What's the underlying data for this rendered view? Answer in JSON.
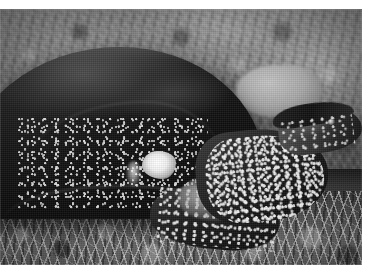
{
  "page": {
    "width": 375,
    "height": 280,
    "background_color": "#ffffff",
    "type": "photograph"
  },
  "photo": {
    "title": "Turtle resting on grass",
    "subject": "turtle",
    "color_mode": "black-and-white",
    "orientation": "landscape",
    "frame": {
      "left": 0,
      "top": 9,
      "width": 362,
      "height": 256,
      "margin_color": "#ffffff"
    },
    "regions": [
      {
        "name": "background-vegetation",
        "label": "Blurred grass and vegetation background",
        "tone": "mid-gray"
      },
      {
        "name": "background-rock",
        "label": "Pale rock behind the shell",
        "tone": "light-gray"
      },
      {
        "name": "turtle-shell",
        "label": "Dark domed carapace",
        "tone": "near-black"
      },
      {
        "name": "shell-speckles",
        "label": "White speckled pattern on shell flank",
        "tone": "white"
      },
      {
        "name": "shell-highlight",
        "label": "Bright blown-out highlight on lower shell",
        "tone": "white"
      },
      {
        "name": "turtle-neck",
        "label": "Speckled neck",
        "tone": "dark-gray"
      },
      {
        "name": "turtle-head",
        "label": "Head facing right with dark upper jaw",
        "tone": "mid-gray"
      },
      {
        "name": "turtle-eye",
        "label": "Eye",
        "tone": "highlight"
      },
      {
        "name": "turtle-foreleg",
        "label": "Speckled foreleg",
        "tone": "dark-gray"
      },
      {
        "name": "foreground-grass",
        "label": "Bright grass blades in foreground",
        "tone": "light-gray"
      }
    ],
    "palette": {
      "white": "#ffffff",
      "highlight": "#f0f0f0",
      "light_gray": "#c8c8c8",
      "mid_gray": "#7b7b7b",
      "dark_gray": "#3a3a3a",
      "shadow": "#141414",
      "black": "#070707"
    }
  }
}
